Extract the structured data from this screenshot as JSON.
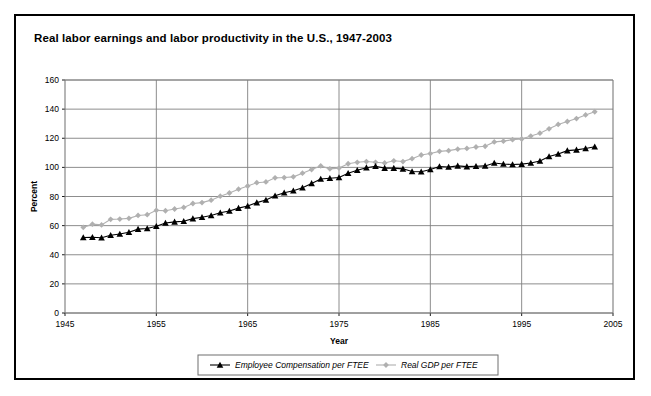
{
  "figure": {
    "title": "Real labor earnings and labor productivity in the U.S.,  1947-2003",
    "border_color": "#000000",
    "background": "#ffffff"
  },
  "chart_data": {
    "type": "line",
    "title": "Real labor earnings and labor productivity in the U.S.,  1947-2003",
    "xlabel": "Year",
    "ylabel": "Percent",
    "xlim": [
      1945,
      2005
    ],
    "ylim": [
      0,
      160
    ],
    "xticks": [
      1945,
      1955,
      1965,
      1975,
      1985,
      1995,
      2005
    ],
    "yticks": [
      0,
      20,
      40,
      60,
      80,
      100,
      120,
      140,
      160
    ],
    "grid": "horizontal-and-vertical",
    "legend_position": "below-axes",
    "x": [
      1947,
      1948,
      1949,
      1950,
      1951,
      1952,
      1953,
      1954,
      1955,
      1956,
      1957,
      1958,
      1959,
      1960,
      1961,
      1962,
      1963,
      1964,
      1965,
      1966,
      1967,
      1968,
      1969,
      1970,
      1971,
      1972,
      1973,
      1974,
      1975,
      1976,
      1977,
      1978,
      1979,
      1980,
      1981,
      1982,
      1983,
      1984,
      1985,
      1986,
      1987,
      1988,
      1989,
      1990,
      1991,
      1992,
      1993,
      1994,
      1995,
      1996,
      1997,
      1998,
      1999,
      2000,
      2001,
      2002,
      2003
    ],
    "series": [
      {
        "name": "Employee Compensation per FTEE",
        "color": "#000000",
        "marker": "triangle",
        "values": [
          51.8,
          52.0,
          51.7,
          53.4,
          54.3,
          55.5,
          57.6,
          58.0,
          59.6,
          61.8,
          62.6,
          63.0,
          64.8,
          65.8,
          67.0,
          68.8,
          70.0,
          72.0,
          73.5,
          75.8,
          77.6,
          80.5,
          82.6,
          84.0,
          86.0,
          89.0,
          92.0,
          92.5,
          93.0,
          96.0,
          98.0,
          99.8,
          100.8,
          99.5,
          99.5,
          99.0,
          97.2,
          97.0,
          98.5,
          100.6,
          100.3,
          101.0,
          100.5,
          100.8,
          101.0,
          103.0,
          102.3,
          102.0,
          102.2,
          103.0,
          104.4,
          107.5,
          109.2,
          111.5,
          112.0,
          113.0,
          114.2
        ]
      },
      {
        "name": "Real GDP per FTEE",
        "color": "#b0b0b0",
        "marker": "diamond",
        "values": [
          58.8,
          61.0,
          60.5,
          64.3,
          64.5,
          65.0,
          67.0,
          67.5,
          70.5,
          70.2,
          71.4,
          72.5,
          75.2,
          75.8,
          77.5,
          80.2,
          82.4,
          85.0,
          87.2,
          89.5,
          90.0,
          92.8,
          93.0,
          93.5,
          96.0,
          98.5,
          101.0,
          99.0,
          99.5,
          102.5,
          103.5,
          104.0,
          103.5,
          103.0,
          104.5,
          104.0,
          106.0,
          108.5,
          109.5,
          111.0,
          111.5,
          112.5,
          113.0,
          114.0,
          114.5,
          117.5,
          118.0,
          119.0,
          119.5,
          121.5,
          123.5,
          126.5,
          129.5,
          131.5,
          133.5,
          136.0,
          138.2
        ]
      }
    ]
  },
  "legend": {
    "items": [
      {
        "label": "Employee Compensation per FTEE",
        "marker": "triangle",
        "color": "#000000"
      },
      {
        "label": "Real GDP per FTEE",
        "marker": "diamond",
        "color": "#b0b0b0"
      }
    ]
  }
}
